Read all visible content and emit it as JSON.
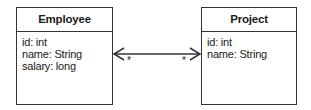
{
  "diagram": {
    "type": "uml-class-diagram",
    "classes": [
      {
        "name": "Employee",
        "attributes": [
          "id: int",
          "name: String",
          "salary: long"
        ]
      },
      {
        "name": "Project",
        "attributes": [
          "id: int",
          "name: String"
        ]
      }
    ],
    "association": {
      "from": "Employee",
      "to": "Project",
      "navigability": "bidirectional",
      "multiplicity_from": "*",
      "multiplicity_to": "*"
    }
  },
  "colors": {
    "stroke": "#333333",
    "text": "#1a1a1a",
    "background": "#ffffff"
  }
}
